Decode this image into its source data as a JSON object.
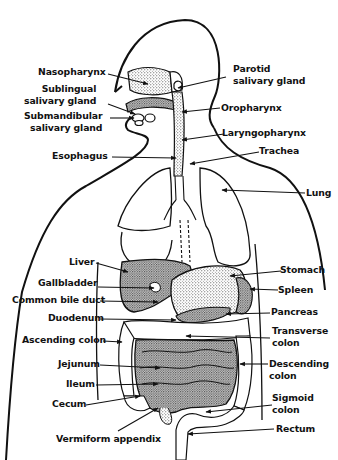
{
  "diagram": {
    "colors": {
      "ink": "#111111",
      "background": "#ffffff",
      "stipple": "#555555"
    },
    "labels_left": [
      {
        "id": "nasopharynx",
        "text": "Nasopharynx"
      },
      {
        "id": "sublingual",
        "text": "Sublingual\nsalivary gland"
      },
      {
        "id": "submandibular",
        "text": "Submandibular\nsalivary gland"
      },
      {
        "id": "esophagus",
        "text": "Esophagus"
      },
      {
        "id": "liver",
        "text": "Liver"
      },
      {
        "id": "gallbladder",
        "text": "Gallbladder"
      },
      {
        "id": "common_bile_duct",
        "text": "Common bile duct"
      },
      {
        "id": "duodenum",
        "text": "Duodenum"
      },
      {
        "id": "ascending_colon",
        "text": "Ascending colon"
      },
      {
        "id": "jejunum",
        "text": "Jejunum"
      },
      {
        "id": "ileum",
        "text": "Ileum"
      },
      {
        "id": "cecum",
        "text": "Cecum"
      },
      {
        "id": "vermiform_appendix",
        "text": "Vermiform appendix"
      }
    ],
    "labels_right": [
      {
        "id": "parotid",
        "text": "Parotid\nsalivary gland"
      },
      {
        "id": "oropharynx",
        "text": "Oropharynx"
      },
      {
        "id": "laryngopharynx",
        "text": "Laryngopharynx"
      },
      {
        "id": "trachea",
        "text": "Trachea"
      },
      {
        "id": "lung",
        "text": "Lung"
      },
      {
        "id": "stomach",
        "text": "Stomach"
      },
      {
        "id": "spleen",
        "text": "Spleen"
      },
      {
        "id": "pancreas",
        "text": "Pancreas"
      },
      {
        "id": "transverse_colon",
        "text": "Transverse\ncolon"
      },
      {
        "id": "descending_colon",
        "text": "Descending\ncolon"
      },
      {
        "id": "sigmoid_colon",
        "text": "Sigmoid\ncolon"
      },
      {
        "id": "rectum",
        "text": "Rectum"
      }
    ]
  }
}
